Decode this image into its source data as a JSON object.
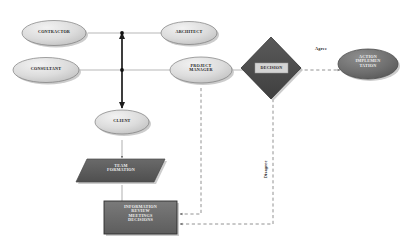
{
  "diagram": {
    "background": "#ffffff",
    "palette": {
      "ellipse_fill_light": "#d9d9d9",
      "ellipse_fill_mid": "#c6c6c6",
      "ellipse_stroke": "#6b6b6b",
      "diamond_fill": "#4d4d4d",
      "diamond_stroke": "#3a3a3a",
      "decision_label_box": "#d6d6d6",
      "parallelogram_fill": "#5a5a5a",
      "box_fill": "#6a6a6a",
      "box_stroke": "#2e2e2e",
      "connector": "#8a8a8a",
      "spine": "#1c1c1c",
      "dashed": "#6f6f6f",
      "shadow": "#b8b8b8"
    },
    "nodes": [
      {
        "id": "contractor",
        "label": "CONTRACTOR",
        "shape": "ellipse",
        "fill": "light"
      },
      {
        "id": "architect",
        "label": "ARCHITECT",
        "shape": "ellipse",
        "fill": "light"
      },
      {
        "id": "consultant",
        "label": "CONSULTANT",
        "shape": "ellipse",
        "fill": "light"
      },
      {
        "id": "project_manager",
        "label": "PROJECT\nMANAGER",
        "shape": "ellipse",
        "fill": "light"
      },
      {
        "id": "client",
        "label": "CLIENT",
        "shape": "ellipse",
        "fill": "light"
      },
      {
        "id": "decision",
        "label": "DECISION",
        "shape": "diamond",
        "fill": "dark"
      },
      {
        "id": "action_implementation",
        "label": "ACTION\nIMPLEMEN\nTATION",
        "shape": "ellipse",
        "fill": "dark"
      },
      {
        "id": "team_formation",
        "label": "TEAM\nFORMATION",
        "shape": "parallelogram",
        "fill": "dark"
      },
      {
        "id": "information_review",
        "label": "INFORMATION\nREVIEW\nMEETINGS\nDECISIONS",
        "shape": "rectangle",
        "fill": "dark"
      }
    ],
    "edge_labels": [
      {
        "id": "agree",
        "text": "Agree",
        "orientation": "horizontal"
      },
      {
        "id": "disagree",
        "text": "Disagree",
        "orientation": "vertical"
      }
    ],
    "connections": [
      {
        "from": "contractor",
        "to": "spine",
        "style": "solid-thin"
      },
      {
        "from": "architect",
        "to": "spine",
        "style": "solid-thin"
      },
      {
        "from": "consultant",
        "to": "spine",
        "style": "solid-thin"
      },
      {
        "from": "project_manager",
        "to": "spine",
        "style": "solid-thin"
      },
      {
        "from": "spine_top",
        "to": "spine_bottom",
        "style": "solid-thick-double-arrow"
      },
      {
        "from": "spine",
        "to": "client",
        "style": "solid-thick-arrow"
      },
      {
        "from": "client",
        "to": "team_formation",
        "style": "solid-thin-arrow"
      },
      {
        "from": "team_formation",
        "to": "information_review",
        "style": "solid-thin-arrow"
      },
      {
        "from": "project_manager",
        "to": "information_review",
        "style": "dashed-arrow"
      },
      {
        "from": "decision",
        "to": "action_implementation",
        "style": "dashed-arrow",
        "label": "agree"
      },
      {
        "from": "decision",
        "to": "information_review",
        "style": "dashed-arrow",
        "label": "disagree"
      },
      {
        "from": "project_manager",
        "to": "decision",
        "style": "solid-thin-arrow"
      }
    ]
  }
}
